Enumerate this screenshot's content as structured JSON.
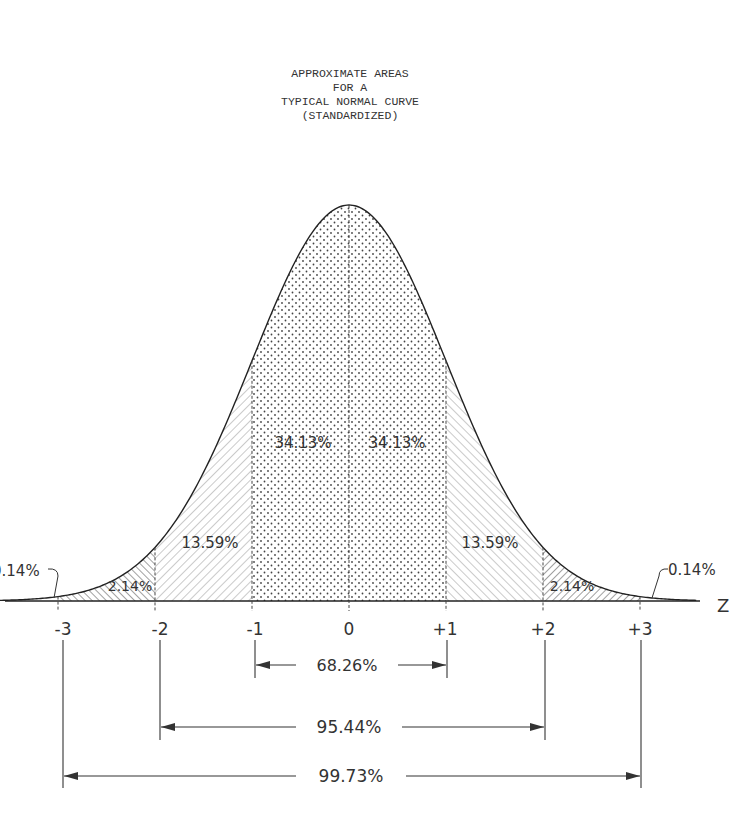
{
  "title": {
    "lines": [
      "APPROXIMATE AREAS",
      "FOR A",
      "TYPICAL NORMAL CURVE",
      "(STANDARDIZED)"
    ]
  },
  "axis": {
    "label": "Z",
    "ticks": [
      "-3",
      "-2",
      "-1",
      "0",
      "+1",
      "+2",
      "+3"
    ]
  },
  "regions": {
    "left_tail": "0.14%",
    "left_2_3": "2.14%",
    "left_1_2": "13.59%",
    "left_0_1": "34.13%",
    "right_0_1": "34.13%",
    "right_1_2": "13.59%",
    "right_2_3": "2.14%",
    "right_tail": "0.14%"
  },
  "ranges": {
    "one_sigma": "68.26%",
    "two_sigma": "95.44%",
    "three_sigma": "99.73%"
  },
  "chart_data": {
    "type": "area",
    "title": "Approximate Areas for a Typical Normal Curve (Standardized)",
    "xlabel": "Z",
    "x_ticks": [
      -3,
      -2,
      -1,
      0,
      1,
      2,
      3
    ],
    "segments": [
      {
        "from": "-inf",
        "to": -3,
        "percent": 0.14
      },
      {
        "from": -3,
        "to": -2,
        "percent": 2.14
      },
      {
        "from": -2,
        "to": -1,
        "percent": 13.59
      },
      {
        "from": -1,
        "to": 0,
        "percent": 34.13
      },
      {
        "from": 0,
        "to": 1,
        "percent": 34.13
      },
      {
        "from": 1,
        "to": 2,
        "percent": 13.59
      },
      {
        "from": 2,
        "to": 3,
        "percent": 2.14
      },
      {
        "from": 3,
        "to": "inf",
        "percent": 0.14
      }
    ],
    "intervals": [
      {
        "from": -1,
        "to": 1,
        "percent": 68.26
      },
      {
        "from": -2,
        "to": 2,
        "percent": 95.44
      },
      {
        "from": -3,
        "to": 3,
        "percent": 99.73
      }
    ]
  }
}
